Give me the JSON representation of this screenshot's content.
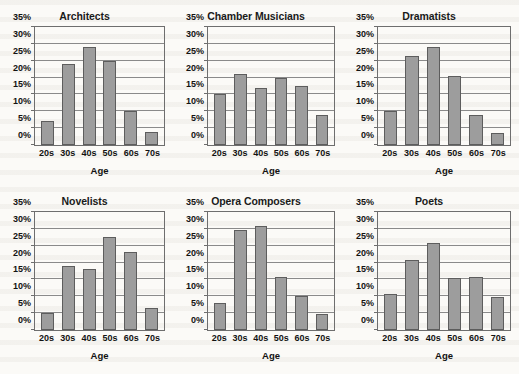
{
  "chart_data": [
    {
      "type": "bar",
      "title": "Architects",
      "xlabel": "Age",
      "ylabel": "",
      "categories": [
        "20s",
        "30s",
        "40s",
        "50s",
        "60s",
        "70s"
      ],
      "values": [
        7,
        24,
        29,
        25,
        10,
        4
      ],
      "ylim": [
        0,
        35
      ],
      "ytick_labels": [
        "0%",
        "5%",
        "10%",
        "15%",
        "20%",
        "25%",
        "30%",
        "35%"
      ],
      "yticks": [
        0,
        5,
        10,
        15,
        20,
        25,
        30,
        35
      ],
      "grid": true,
      "legend": "none"
    },
    {
      "type": "bar",
      "title": "Chamber Musicians",
      "xlabel": "Age",
      "ylabel": "",
      "categories": [
        "20s",
        "30s",
        "40s",
        "50s",
        "60s",
        "70s"
      ],
      "values": [
        15,
        21,
        17,
        20,
        17.5,
        9
      ],
      "ylim": [
        0,
        35
      ],
      "ytick_labels": [
        "0%",
        "5%",
        "10%",
        "15%",
        "20%",
        "25%",
        "30%",
        "35%"
      ],
      "yticks": [
        0,
        5,
        10,
        15,
        20,
        25,
        30,
        35
      ],
      "grid": true,
      "legend": "none"
    },
    {
      "type": "bar",
      "title": "Dramatists",
      "xlabel": "Age",
      "ylabel": "",
      "categories": [
        "20s",
        "30s",
        "40s",
        "50s",
        "60s",
        "70s"
      ],
      "values": [
        10,
        26.5,
        29,
        20.5,
        9,
        3.5
      ],
      "ylim": [
        0,
        35
      ],
      "ytick_labels": [
        "0%",
        "5%",
        "10%",
        "15%",
        "20%",
        "25%",
        "30%",
        "35%"
      ],
      "yticks": [
        0,
        5,
        10,
        15,
        20,
        25,
        30,
        35
      ],
      "grid": true,
      "legend": "none"
    },
    {
      "type": "bar",
      "title": "Novelists",
      "xlabel": "Age",
      "ylabel": "",
      "categories": [
        "20s",
        "30s",
        "40s",
        "50s",
        "60s",
        "70s"
      ],
      "values": [
        5,
        19,
        18.2,
        27.7,
        23,
        6.5
      ],
      "ylim": [
        0,
        35
      ],
      "ytick_labels": [
        "0%",
        "5%",
        "10%",
        "15%",
        "20%",
        "25%",
        "30%",
        "35%"
      ],
      "yticks": [
        0,
        5,
        10,
        15,
        20,
        25,
        30,
        35
      ],
      "grid": true,
      "legend": "none"
    },
    {
      "type": "bar",
      "title": "Opera Composers",
      "xlabel": "Age",
      "ylabel": "",
      "categories": [
        "20s",
        "30s",
        "40s",
        "50s",
        "60s",
        "70s"
      ],
      "values": [
        8,
        29.8,
        31,
        15.7,
        10,
        4.7
      ],
      "ylim": [
        0,
        35
      ],
      "ytick_labels": [
        "0%",
        "5%",
        "10%",
        "15%",
        "20%",
        "25%",
        "30%",
        "35%"
      ],
      "yticks": [
        0,
        5,
        10,
        15,
        20,
        25,
        30,
        35
      ],
      "grid": true,
      "legend": "none"
    },
    {
      "type": "bar",
      "title": "Poets",
      "xlabel": "Age",
      "ylabel": "",
      "categories": [
        "20s",
        "30s",
        "40s",
        "50s",
        "60s",
        "70s"
      ],
      "values": [
        10.7,
        20.7,
        25.8,
        15.5,
        15.6,
        9.8
      ],
      "ylim": [
        0,
        35
      ],
      "ytick_labels": [
        "0%",
        "5%",
        "10%",
        "15%",
        "20%",
        "25%",
        "30%",
        "35%"
      ],
      "yticks": [
        0,
        5,
        10,
        15,
        20,
        25,
        30,
        35
      ],
      "grid": true,
      "legend": "none"
    }
  ],
  "style": {
    "bar_fill": "#9d9d9d",
    "bar_stroke": "#5d5d5d",
    "axis_color": "#6e6e6e",
    "grid_color": "#8a8a8a",
    "text_color": "#121212",
    "page_background": "#fbfaf7"
  }
}
